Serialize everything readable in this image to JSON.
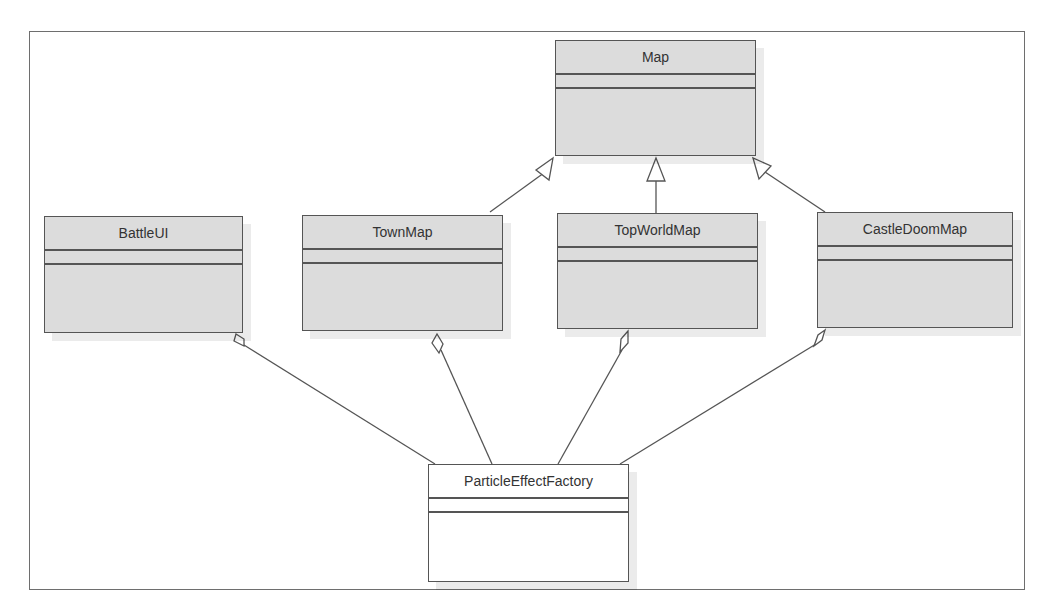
{
  "diagram": {
    "type": "UML class diagram",
    "classes": [
      {
        "id": "map",
        "name": "Map"
      },
      {
        "id": "battleui",
        "name": "BattleUI"
      },
      {
        "id": "townmap",
        "name": "TownMap"
      },
      {
        "id": "topworldmap",
        "name": "TopWorldMap"
      },
      {
        "id": "castledoommap",
        "name": "CastleDoomMap"
      },
      {
        "id": "particleeffectfactory",
        "name": "ParticleEffectFactory"
      }
    ],
    "relationships": [
      {
        "type": "generalization",
        "from": "TownMap",
        "to": "Map"
      },
      {
        "type": "generalization",
        "from": "TopWorldMap",
        "to": "Map"
      },
      {
        "type": "generalization",
        "from": "CastleDoomMap",
        "to": "Map"
      },
      {
        "type": "aggregation",
        "whole": "BattleUI",
        "part": "ParticleEffectFactory"
      },
      {
        "type": "aggregation",
        "whole": "TownMap",
        "part": "ParticleEffectFactory"
      },
      {
        "type": "aggregation",
        "whole": "TopWorldMap",
        "part": "ParticleEffectFactory"
      },
      {
        "type": "aggregation",
        "whole": "CastleDoomMap",
        "part": "ParticleEffectFactory"
      }
    ]
  },
  "colors": {
    "class_fill": "#dcdcdc",
    "factory_fill": "#ffffff",
    "line": "#555555"
  }
}
